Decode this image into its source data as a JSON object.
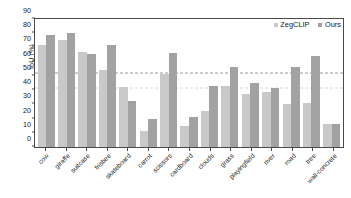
{
  "chart_data": {
    "type": "bar",
    "title": "",
    "xlabel": "",
    "ylabel": "IoU (%)",
    "ylim": [
      0,
      90
    ],
    "yticks": [
      0,
      10,
      20,
      30,
      40,
      50,
      60,
      70,
      80,
      90
    ],
    "grid": false,
    "legend_position": "top-right",
    "reference_lines": [
      {
        "value": 51,
        "style": "dashed",
        "color": "#9a9aa8"
      },
      {
        "value": 41,
        "style": "dashed",
        "color": "#d8d8dc"
      }
    ],
    "categories": [
      "cow",
      "giraffe",
      "suitcase",
      "frisbee",
      "skateboard",
      "carrot",
      "scissors",
      "cardboard",
      "clouds",
      "grass",
      "playingfield",
      "river",
      "road",
      "tree",
      "wall-concrete"
    ],
    "series": [
      {
        "name": "ZegCLIP",
        "color": "#c9c9c9",
        "values": [
          72,
          75.5,
          66.5,
          54.5,
          42,
          11.5,
          51,
          15,
          25,
          43,
          37,
          38.5,
          30,
          31,
          16
        ]
      },
      {
        "name": "Ours",
        "color": "#a2a2a2",
        "values": [
          79,
          80,
          65.5,
          71.5,
          32.5,
          20,
          66,
          21,
          43,
          56,
          45,
          41.5,
          56,
          64,
          16.5
        ]
      }
    ]
  },
  "colors": {
    "series_zegclip": "#c9c9c9",
    "series_ours": "#a2a2a2",
    "axis": "#4a4a4a",
    "reference_line": "#9a9aa8",
    "background": "#ffffff"
  }
}
